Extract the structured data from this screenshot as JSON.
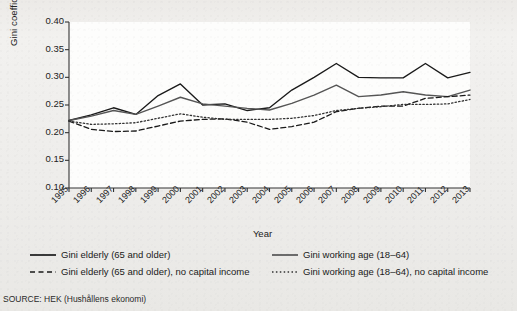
{
  "figure": {
    "source_note": "SOURCE: HEK (Hushållens ekonomi)",
    "axis_color": "#333333"
  },
  "legend": {
    "items": [
      {
        "label": "Gini elderly (65 and older)",
        "style": "solid",
        "color": "#1a1a1a",
        "name": "gini-elderly"
      },
      {
        "label": "Gini working age (18–64)",
        "style": "solid",
        "color": "#555555",
        "name": "gini-working-age"
      },
      {
        "label": "Gini elderly (65 and older), no capital income",
        "style": "dashed",
        "color": "#1a1a1a",
        "name": "gini-elderly-no-capital"
      },
      {
        "label": "Gini working age (18–64), no capital income",
        "style": "dotted",
        "color": "#333333",
        "name": "gini-working-age-no-capital"
      }
    ]
  },
  "chart_data": {
    "type": "line",
    "title": "",
    "xlabel": "Year",
    "ylabel": "Gini coefficient",
    "ylim": [
      0.1,
      0.4
    ],
    "yticks": [
      0.1,
      0.15,
      0.2,
      0.25,
      0.3,
      0.35,
      0.4
    ],
    "ytick_labels": [
      "0.10",
      "0.15",
      "0.20",
      "0.25",
      "0.30",
      "0.35",
      "0.40"
    ],
    "grid": false,
    "legend_position": "below",
    "x": [
      1995,
      1996,
      1997,
      1998,
      1999,
      2000,
      2001,
      2002,
      2003,
      2004,
      2005,
      2006,
      2007,
      2008,
      2009,
      2010,
      2011,
      2012,
      2013
    ],
    "categories": [
      "1995",
      "1996",
      "1997",
      "1998",
      "1999",
      "2000",
      "2001",
      "2002",
      "2003",
      "2004",
      "2005",
      "2006",
      "2007",
      "2008",
      "2009",
      "2010",
      "2011",
      "2012",
      "2013"
    ],
    "series": [
      {
        "name": "Gini elderly (65 and older)",
        "style": "solid",
        "color": "#1a1a1a",
        "values": [
          0.222,
          0.232,
          0.245,
          0.233,
          0.267,
          0.288,
          0.25,
          0.252,
          0.24,
          0.245,
          0.277,
          0.3,
          0.325,
          0.3,
          0.299,
          0.299,
          0.325,
          0.299,
          0.309
        ]
      },
      {
        "name": "Gini working age (18–64)",
        "style": "solid",
        "color": "#555555",
        "values": [
          0.222,
          0.23,
          0.24,
          0.233,
          0.248,
          0.264,
          0.252,
          0.248,
          0.244,
          0.241,
          0.253,
          0.268,
          0.286,
          0.265,
          0.268,
          0.274,
          0.268,
          0.265,
          0.277
        ]
      },
      {
        "name": "Gini elderly (65 and older), no capital income",
        "style": "dashed",
        "color": "#1a1a1a",
        "values": [
          0.221,
          0.206,
          0.202,
          0.203,
          0.212,
          0.221,
          0.224,
          0.225,
          0.219,
          0.206,
          0.211,
          0.219,
          0.238,
          0.244,
          0.248,
          0.248,
          0.262,
          0.265,
          0.268
        ]
      },
      {
        "name": "Gini working age (18–64), no capital income",
        "style": "dotted",
        "color": "#333333",
        "values": [
          0.221,
          0.215,
          0.216,
          0.218,
          0.226,
          0.234,
          0.228,
          0.224,
          0.224,
          0.224,
          0.226,
          0.231,
          0.24,
          0.244,
          0.247,
          0.251,
          0.251,
          0.252,
          0.26
        ]
      }
    ]
  }
}
